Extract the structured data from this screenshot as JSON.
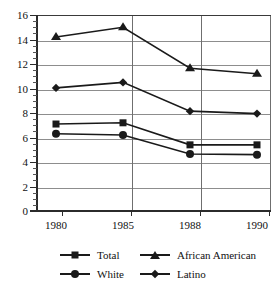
{
  "chart_data": {
    "type": "line",
    "title": "",
    "xlabel": "",
    "ylabel": "",
    "categories": [
      "1980",
      "1985",
      "1988",
      "1990"
    ],
    "ylim": [
      0,
      16
    ],
    "y_ticks": [
      0,
      2,
      4,
      6,
      8,
      10,
      12,
      14,
      16
    ],
    "y_tick_labels": [
      "0",
      "2",
      "4",
      "6",
      "8",
      "10",
      "12",
      "14",
      "16"
    ],
    "y_minor_tick_step": 0.5,
    "grid": true,
    "grid_axis": "both",
    "legend_position": "bottom",
    "series": [
      {
        "name": "Total",
        "marker": "square",
        "values": [
          7.1,
          7.2,
          5.4,
          5.4
        ]
      },
      {
        "name": "African American",
        "marker": "triangle",
        "values": [
          14.2,
          15.0,
          11.65,
          11.2
        ]
      },
      {
        "name": "White",
        "marker": "circle",
        "values": [
          6.3,
          6.2,
          4.65,
          4.6
        ]
      },
      {
        "name": "Latino",
        "marker": "diamond",
        "values": [
          10.05,
          10.5,
          8.15,
          7.95
        ]
      }
    ]
  },
  "legend": {
    "entries": [
      {
        "label": "Total",
        "marker": "square"
      },
      {
        "label": "African American",
        "marker": "triangle"
      },
      {
        "label": "White",
        "marker": "circle"
      },
      {
        "label": "Latino",
        "marker": "diamond"
      }
    ]
  },
  "colors": {
    "line": "#1a1a1a",
    "marker": "#1a1a1a",
    "grid": "#8d8d8d",
    "axis": "#2b2b2b",
    "background": "#ffffff"
  }
}
